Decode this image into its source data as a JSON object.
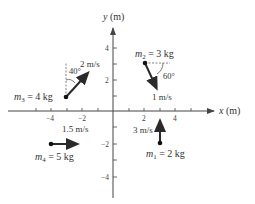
{
  "diagram": {
    "axes": {
      "x_label": "x (m)",
      "y_label": "y (m)",
      "x_ticks": [
        {
          "label": "−4",
          "value": -4
        },
        {
          "label": "−2",
          "value": -2
        },
        {
          "label": "2",
          "value": 2
        },
        {
          "label": "4",
          "value": 4
        }
      ],
      "y_ticks": [
        {
          "label": "4",
          "value": 4
        },
        {
          "label": "2",
          "value": 2
        },
        {
          "label": "−2",
          "value": -2
        },
        {
          "label": "−4",
          "value": -4
        }
      ]
    },
    "masses": [
      {
        "id": "m1",
        "sym": "m",
        "sub": "1",
        "rest": " = 2 kg",
        "speed": "3 m/s",
        "angle": ""
      },
      {
        "id": "m2",
        "sym": "m",
        "sub": "2",
        "rest": " = 3 kg",
        "speed": "1 m/s",
        "angle": "60°"
      },
      {
        "id": "m3",
        "sym": "m",
        "sub": "3",
        "rest": " = 4 kg",
        "speed": "2 m/s",
        "angle": "40°"
      },
      {
        "id": "m4",
        "sym": "m",
        "sub": "4",
        "rest": " = 5 kg",
        "speed": "1.5 m/s",
        "angle": ""
      }
    ]
  },
  "colors": {
    "axis": "#444444",
    "arrow": "#2a2a2a",
    "text": "#333333"
  }
}
